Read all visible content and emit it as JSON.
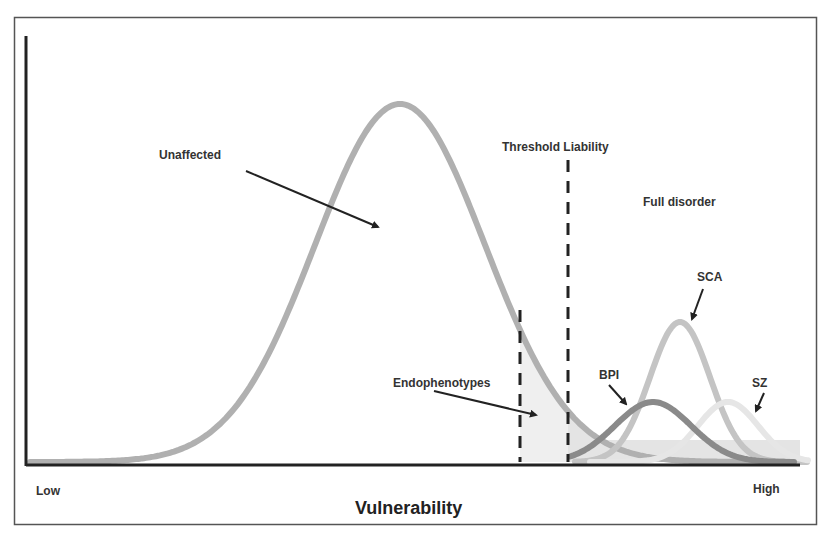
{
  "chart_data": {
    "type": "diagram",
    "title": "",
    "xlabel": "Vulnerability",
    "ylabel": "",
    "x_tick_labels": {
      "left": "Low",
      "right": "High"
    },
    "grid": false,
    "legend": null,
    "distributions": [
      {
        "name": "Unaffected",
        "color": "#b0b0b0",
        "peak_x": 400,
        "peak_y": 104,
        "sigma_px": 85
      },
      {
        "name": "BPI",
        "color": "#8a8a8a",
        "peak_x": 653,
        "peak_y": 402,
        "sigma_px": 38
      },
      {
        "name": "SCA",
        "color": "#c4c4c4",
        "peak_x": 680,
        "peak_y": 322,
        "sigma_px": 30
      },
      {
        "name": "SZ",
        "color": "#e6e6e6",
        "peak_x": 728,
        "peak_y": 402,
        "sigma_px": 30
      }
    ],
    "thresholds": [
      {
        "name": "Endophenotypes boundary",
        "x": 520,
        "y_top": 310
      },
      {
        "name": "Threshold Liability",
        "x": 568,
        "y_top": 160
      }
    ],
    "regions": [
      {
        "name": "Endophenotypes",
        "from_x": 520,
        "to_x": 568,
        "fill": "#efefef"
      },
      {
        "name": "Full disorder",
        "from_x": 568,
        "to_x": 800,
        "fill": "#e4e4e4"
      }
    ]
  },
  "labels": {
    "unaffected": "Unaffected",
    "threshold": "Threshold Liability",
    "full_disorder": "Full disorder",
    "sca": "SCA",
    "bpi": "BPI",
    "sz": "SZ",
    "endophenotypes": "Endophenotypes",
    "low": "Low",
    "high": "High",
    "x_axis_title": "Vulnerability"
  }
}
